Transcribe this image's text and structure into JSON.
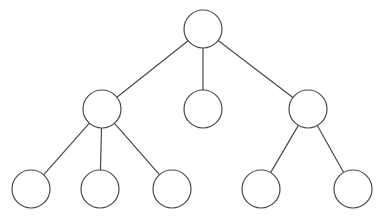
{
  "diagram": {
    "type": "tree",
    "width": 382,
    "height": 220,
    "stroke_color": "#4a4a4a",
    "node_fill": "#ffffff",
    "stroke_width": 1.2,
    "node_radius": 19,
    "nodes": [
      {
        "id": "root",
        "cx": 203,
        "cy": 29,
        "label": ""
      },
      {
        "id": "n1",
        "cx": 102,
        "cy": 109,
        "label": ""
      },
      {
        "id": "n2",
        "cx": 203,
        "cy": 109,
        "label": ""
      },
      {
        "id": "n3",
        "cx": 308,
        "cy": 109,
        "label": ""
      },
      {
        "id": "n1a",
        "cx": 31,
        "cy": 189,
        "label": ""
      },
      {
        "id": "n1b",
        "cx": 100,
        "cy": 189,
        "label": ""
      },
      {
        "id": "n1c",
        "cx": 172,
        "cy": 189,
        "label": ""
      },
      {
        "id": "n3a",
        "cx": 261,
        "cy": 189,
        "label": ""
      },
      {
        "id": "n3b",
        "cx": 353,
        "cy": 189,
        "label": ""
      }
    ],
    "edges": [
      {
        "from": "root",
        "to": "n1"
      },
      {
        "from": "root",
        "to": "n2"
      },
      {
        "from": "root",
        "to": "n3"
      },
      {
        "from": "n1",
        "to": "n1a"
      },
      {
        "from": "n1",
        "to": "n1b"
      },
      {
        "from": "n1",
        "to": "n1c"
      },
      {
        "from": "n3",
        "to": "n3a"
      },
      {
        "from": "n3",
        "to": "n3b"
      }
    ]
  }
}
